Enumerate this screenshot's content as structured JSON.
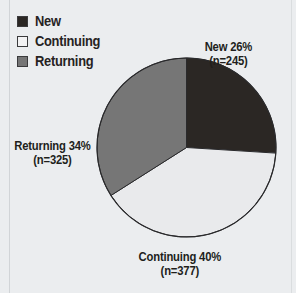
{
  "chart_data": {
    "type": "pie",
    "title": "",
    "categories": [
      "New",
      "Continuing",
      "Returning"
    ],
    "values": [
      26,
      40,
      34
    ],
    "counts": [
      245,
      377,
      325
    ],
    "value_unit": "%",
    "total_n": 947,
    "start_angle_deg": 0,
    "direction": "clockwise",
    "legend_position": "top-left",
    "grid": false,
    "slices": [
      {
        "label": "New",
        "percent": 26,
        "n": 245,
        "percent_text": "New 26%",
        "n_text": "(n=245)",
        "color": "#2b2724",
        "start_deg": 0,
        "end_deg": 93.6
      },
      {
        "label": "Continuing",
        "percent": 40,
        "n": 377,
        "percent_text": "Continuing 40%",
        "n_text": "(n=377)",
        "color": "#e9eaec",
        "start_deg": 93.6,
        "end_deg": 237.6
      },
      {
        "label": "Returning",
        "percent": 34,
        "n": 325,
        "percent_text": "Returning 34%",
        "n_text": "(n=325)",
        "color": "#767676",
        "start_deg": 237.6,
        "end_deg": 360
      }
    ]
  },
  "legend": {
    "items": [
      {
        "label": "New",
        "color": "#2b2724"
      },
      {
        "label": "Continuing",
        "color": "#f2f2f3"
      },
      {
        "label": "Returning",
        "color": "#767676"
      }
    ]
  },
  "callouts": {
    "new": {
      "pct": "New 26%",
      "n": "(n=245)"
    },
    "returning": {
      "pct": "Returning 34%",
      "n": "(n=325)"
    },
    "continuing": {
      "pct": "Continuing 40%",
      "n": "(n=377)"
    }
  },
  "style": {
    "background": "#ebedef",
    "outline": "#2a2a2c",
    "text": "#211e1b"
  }
}
